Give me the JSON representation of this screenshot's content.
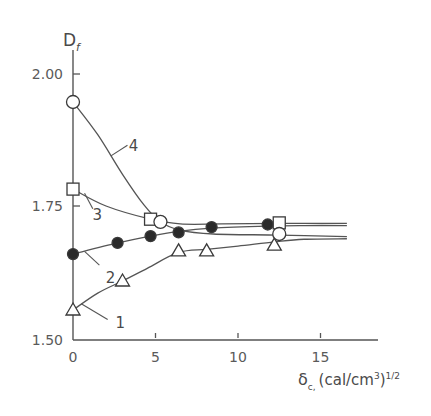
{
  "chart_data": {
    "type": "line",
    "title": "",
    "xlabel": "δc, (cal/cm3)1/2",
    "xlabel_parts": {
      "symbol": "δ",
      "subscript": "c,",
      "unit": "(cal/cm",
      "unit_sup": "3",
      "close": ")",
      "power": "1/2"
    },
    "ylabel": "Df",
    "ylabel_parts": {
      "symbol": "D",
      "subscript": "f"
    },
    "xlim": [
      0,
      17
    ],
    "ylim": [
      1.5,
      2.05
    ],
    "x_ticks": [
      0,
      5,
      10,
      15
    ],
    "x_tick_labels": [
      "0",
      "5",
      "10",
      "15"
    ],
    "y_ticks": [
      1.5,
      1.75,
      2.0
    ],
    "y_tick_labels": [
      "1.50",
      "1.75",
      "2.00"
    ],
    "grid": false,
    "legend": "inline curve numbers",
    "series": [
      {
        "name": "1",
        "marker": "open-triangle",
        "points": [
          [
            0,
            1.553
          ],
          [
            3.0,
            1.608
          ],
          [
            6.4,
            1.665
          ],
          [
            8.1,
            1.665
          ],
          [
            12.2,
            1.676
          ]
        ],
        "curve": [
          [
            0,
            1.553
          ],
          [
            1.5,
            1.585
          ],
          [
            3.0,
            1.608
          ],
          [
            4.5,
            1.632
          ],
          [
            6.4,
            1.662
          ],
          [
            8.1,
            1.668
          ],
          [
            10,
            1.674
          ],
          [
            12.2,
            1.682
          ],
          [
            14,
            1.687
          ],
          [
            16.6,
            1.688
          ]
        ],
        "label_pos": [
          2.4,
          1.53
        ]
      },
      {
        "name": "2",
        "marker": "filled-circle",
        "points": [
          [
            0,
            1.659
          ],
          [
            2.7,
            1.68
          ],
          [
            4.7,
            1.693
          ],
          [
            6.4,
            1.7
          ],
          [
            8.4,
            1.71
          ],
          [
            11.8,
            1.715
          ]
        ],
        "curve": [
          [
            0,
            1.659
          ],
          [
            2.7,
            1.68
          ],
          [
            4.7,
            1.693
          ],
          [
            6.4,
            1.702
          ],
          [
            8.4,
            1.708
          ],
          [
            11.8,
            1.712
          ],
          [
            14,
            1.713
          ],
          [
            16.6,
            1.713
          ]
        ],
        "label_pos": [
          1.8,
          1.615
        ]
      },
      {
        "name": "3",
        "marker": "open-square",
        "points": [
          [
            0,
            1.782
          ],
          [
            4.7,
            1.725
          ],
          [
            12.5,
            1.718
          ]
        ],
        "curve": [
          [
            0,
            1.782
          ],
          [
            2.0,
            1.75
          ],
          [
            4.7,
            1.725
          ],
          [
            6.5,
            1.716
          ],
          [
            9,
            1.716
          ],
          [
            12.5,
            1.717
          ],
          [
            16.6,
            1.717
          ]
        ],
        "label_pos": [
          1.0,
          1.735
        ]
      },
      {
        "name": "4",
        "marker": "open-circle",
        "points": [
          [
            0,
            1.947
          ],
          [
            5.3,
            1.72
          ],
          [
            12.5,
            1.697
          ]
        ],
        "curve": [
          [
            0,
            1.947
          ],
          [
            1.5,
            1.885
          ],
          [
            3.0,
            1.81
          ],
          [
            4.3,
            1.752
          ],
          [
            5.3,
            1.72
          ],
          [
            6.4,
            1.705
          ],
          [
            8.5,
            1.697
          ],
          [
            12.5,
            1.695
          ],
          [
            16.6,
            1.692
          ]
        ],
        "label_pos": [
          3.2,
          1.865
        ]
      }
    ]
  },
  "axes": {
    "y_title_main": "D",
    "y_title_sub": "f",
    "x_title_main": "δ",
    "x_title_sub": "c,",
    "x_title_unit": "(cal/cm",
    "x_title_unit_sup": "3",
    "x_title_close": ")",
    "x_title_power": "1/2"
  },
  "colors": {
    "line": "#555555",
    "marker_fill": "#ffffff",
    "marker_filled": "#2a2a2a",
    "text": "#4a4a4a"
  }
}
